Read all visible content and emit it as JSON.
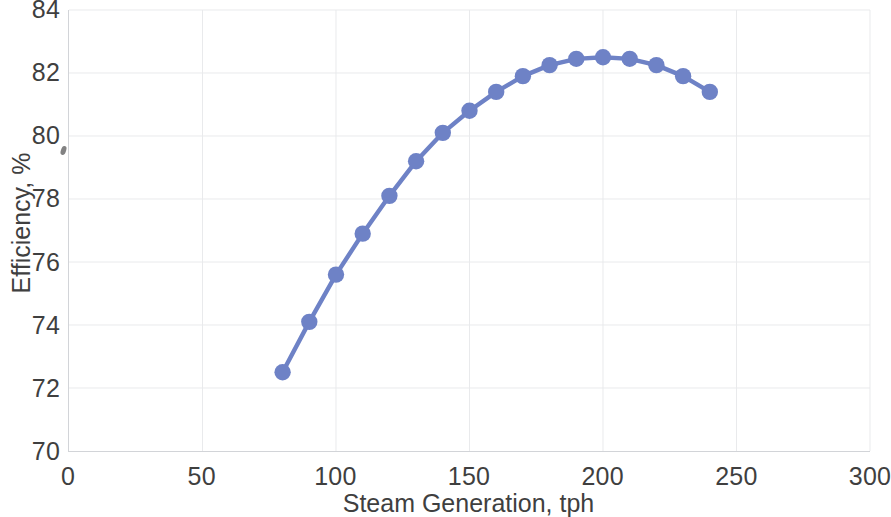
{
  "chart_data": {
    "type": "line",
    "title": "",
    "xlabel": "Steam Generation, tph",
    "ylabel": "Efficiency, %",
    "xlim": [
      0,
      300
    ],
    "ylim": [
      70,
      84
    ],
    "xticks": [
      0,
      50,
      100,
      150,
      200,
      250,
      300
    ],
    "yticks": [
      70,
      72,
      74,
      76,
      78,
      80,
      82,
      84
    ],
    "xtick_labels": [
      "0",
      "50",
      "100",
      "150",
      "200",
      "250",
      "300"
    ],
    "ytick_labels": [
      "70",
      "72",
      "74",
      "76",
      "78",
      "80",
      "82",
      "84"
    ],
    "grid": true,
    "legend": false,
    "marker": "circle",
    "series_color": "#6e82c6",
    "grid_color": "#e9eaec",
    "axis_color": "#d2d4d8",
    "x": [
      80,
      90,
      100,
      110,
      120,
      130,
      140,
      150,
      160,
      170,
      180,
      190,
      200,
      210,
      220,
      230,
      240
    ],
    "y": [
      72.5,
      74.1,
      75.6,
      76.9,
      78.1,
      79.2,
      80.1,
      80.8,
      81.4,
      81.9,
      82.25,
      82.45,
      82.5,
      82.45,
      82.25,
      81.9,
      81.4
    ],
    "series": [
      {
        "name": "Efficiency",
        "x": [
          80,
          90,
          100,
          110,
          120,
          130,
          140,
          150,
          160,
          170,
          180,
          190,
          200,
          210,
          220,
          230,
          240
        ],
        "values": [
          72.5,
          74.1,
          75.6,
          76.9,
          78.1,
          79.2,
          80.1,
          80.8,
          81.4,
          81.9,
          82.25,
          82.45,
          82.5,
          82.45,
          82.25,
          81.9,
          81.4
        ]
      }
    ]
  }
}
